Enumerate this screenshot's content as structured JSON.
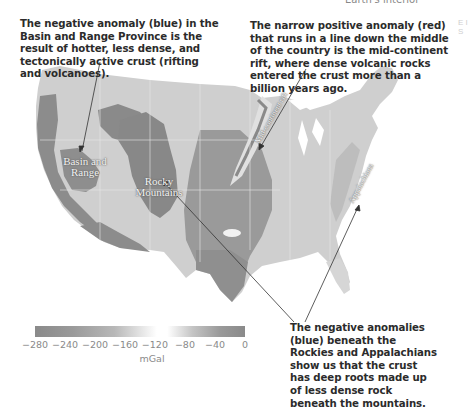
{
  "header": {
    "snippet": "Earth's interior"
  },
  "edge_snippet": "E I S",
  "captions": {
    "basin": "The negative anomaly (blue) in the Basin and Range Province is the result of hotter, less dense, and tectonically active crust (rifting and volcanoes).",
    "rift": "The narrow positive anomaly (red) that runs in a line down the middle of the country is the mid-continent rift, where dense volcanic rocks entered the crust more than a billion years ago.",
    "roots": "The negative anomalies (blue) beneath the Rockies and Appalachians show us that the crust has deep roots made up of less dense rock beneath the mountains."
  },
  "map_labels": {
    "basin": "Basin and Range",
    "rocky": "Rocky Mountains",
    "rift": "Mid-continent rift",
    "appalachians": "Appalachians"
  },
  "legend": {
    "ticks": [
      "−280",
      "−240",
      "−200",
      "−160",
      "−120",
      "−80",
      "−40",
      "0"
    ],
    "unit": "mGal",
    "colors": {
      "low": "#8a8a8a",
      "mid": "#ffffff",
      "high": "#8a8a8a"
    }
  }
}
